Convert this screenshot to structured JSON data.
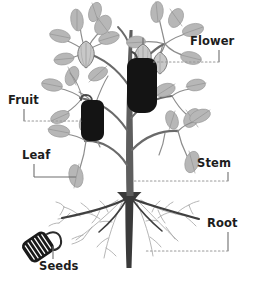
{
  "diagram": {
    "type": "botanical-labeled-diagram",
    "background_color": "#ffffff",
    "colors": {
      "leaf_fill": "#b5b5b5",
      "leaf_stroke": "#8e8e8e",
      "flower_fill": "#c6c6c6",
      "flower_stroke": "#6f6f6f",
      "fruit_fill": "#141414",
      "seed_pod_fill": "#1a1a1a",
      "seed_stripe": "#ffffff",
      "stem_color": "#5a5a5a",
      "root_main_color": "#3d3d3d",
      "root_fine_color": "#a3a3a3",
      "label_text_color": "#1d1d1d",
      "leader_solid_color": "#6e6e6e",
      "leader_dotted_color": "#9a9a9a"
    },
    "labels": [
      {
        "id": "flower",
        "text": "Flower",
        "points_to": "flower-bud-cluster",
        "leader_style": "dotted-with-vertical-tick",
        "side": "right"
      },
      {
        "id": "fruit",
        "text": "Fruit",
        "points_to": "fruit-pod-small",
        "leader_style": "solid-elbow-then-dotted",
        "side": "left"
      },
      {
        "id": "leaf",
        "text": "Leaf",
        "points_to": "lower-left-leaf",
        "leader_style": "solid-elbow",
        "side": "left"
      },
      {
        "id": "stem",
        "text": "Stem",
        "points_to": "main-stem",
        "leader_style": "dotted-with-vertical-tick",
        "side": "right"
      },
      {
        "id": "root",
        "text": "Root",
        "points_to": "lateral-root",
        "leader_style": "dotted-with-vertical-tick",
        "side": "right"
      },
      {
        "id": "seeds",
        "text": "Seeds",
        "points_to": "seed-pod",
        "leader_style": "solid-elbow",
        "side": "left"
      }
    ],
    "parts": {
      "flower_bud_count": 3,
      "fruit_pod_count": 2,
      "leaf_count": 17,
      "seed_pod_count": 1,
      "root_type": "taproot-with-laterals"
    }
  }
}
